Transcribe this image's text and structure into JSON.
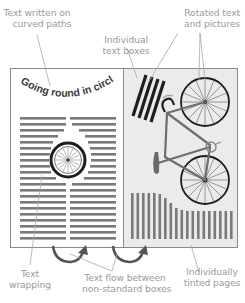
{
  "diagram": {
    "type": "annotated-illustration",
    "colors": {
      "label_text": "#9a9a9a",
      "leader_line": "#a8a8a8",
      "page_border": "#8a8a8a",
      "left_page_fill": "#ffffff",
      "right_page_fill": "#ebebeb",
      "text_line": "#7a7a7a",
      "dark_ink": "#1e1e1e",
      "arrow": "#555555"
    },
    "labels": {
      "curved_paths": [
        "Text written on",
        "curved paths"
      ],
      "text_boxes": [
        "Individual",
        "text boxes"
      ],
      "rotated": [
        "Rotated text",
        "and pictures"
      ],
      "wrapping": [
        "Text",
        "wrapping"
      ],
      "text_flow": [
        "Text flow between",
        "non-standard boxes"
      ],
      "tinted": [
        "Individually",
        "tinted pages"
      ]
    },
    "left_page": {
      "curved_text": "Going round in circles",
      "image": "bicycle-wheel"
    },
    "right_page": {
      "image": "bicycle"
    }
  }
}
